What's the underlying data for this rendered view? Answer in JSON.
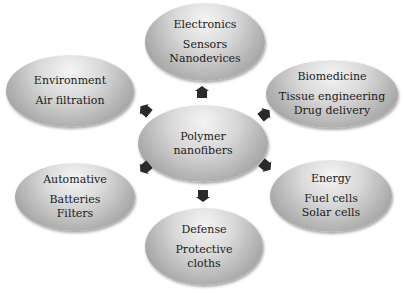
{
  "diagram": {
    "center": {
      "lines": [
        "Polymer",
        "nanofibers"
      ]
    },
    "nodes": [
      {
        "id": "electronics",
        "title": "Electronics",
        "items": [
          "Sensors",
          "Nanodevices"
        ]
      },
      {
        "id": "environment",
        "title": "Environment",
        "items": [
          "Air filtration"
        ]
      },
      {
        "id": "biomedicine",
        "title": "Biomedicine",
        "items": [
          "Tissue engineering",
          "Drug delivery"
        ]
      },
      {
        "id": "automative",
        "title": "Automative",
        "items": [
          "Batteries",
          "Filters"
        ]
      },
      {
        "id": "energy",
        "title": "Energy",
        "items": [
          "Fuel cells",
          "Solar cells"
        ]
      },
      {
        "id": "defense",
        "title": "Defense",
        "items": [
          "Protective",
          "cloths"
        ]
      }
    ],
    "arrows": [
      "up",
      "up-left",
      "up-right",
      "down-left",
      "down-right",
      "down"
    ],
    "colors": {
      "arrow": "#2a2a2a",
      "node_light": "#f4f4f4",
      "node_dark": "#8a8a8a",
      "text": "#1a1a1a"
    }
  }
}
